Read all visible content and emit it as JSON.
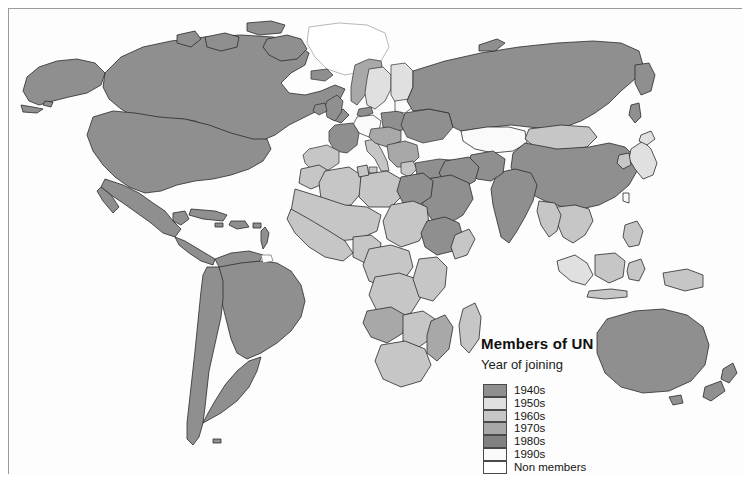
{
  "map": {
    "title": "Members of UN",
    "subtitle": "Year of joining",
    "projection": "world",
    "background_color": "#fdfdfd",
    "border_color": "#9b9b9b",
    "country_outline_color": "#2b2b2b"
  },
  "legend": {
    "title": "Members of UN",
    "subtitle": "Year of joining",
    "entries": [
      {
        "label": "1940s",
        "color": "#8f8f8f"
      },
      {
        "label": "1950s",
        "color": "#e0e0e0"
      },
      {
        "label": "1960s",
        "color": "#c6c6c6"
      },
      {
        "label": "1970s",
        "color": "#a8a8a8"
      },
      {
        "label": "1980s",
        "color": "#818181"
      },
      {
        "label": "1990s",
        "color": "#fafafa"
      },
      {
        "label": "Non members",
        "color": "#ffffff"
      }
    ]
  },
  "regions": [
    {
      "name": "Canada",
      "class": "1940s"
    },
    {
      "name": "United States",
      "class": "1940s"
    },
    {
      "name": "Greenland",
      "class": "Non members"
    },
    {
      "name": "Mexico",
      "class": "1940s"
    },
    {
      "name": "Brazil",
      "class": "1940s"
    },
    {
      "name": "Argentina",
      "class": "1940s"
    },
    {
      "name": "Russia",
      "class": "1940s"
    },
    {
      "name": "China",
      "class": "1940s"
    },
    {
      "name": "India",
      "class": "1940s"
    },
    {
      "name": "Australia",
      "class": "1940s"
    },
    {
      "name": "Egypt",
      "class": "1940s"
    },
    {
      "name": "Ethiopia",
      "class": "1940s"
    },
    {
      "name": "Japan",
      "class": "1950s"
    },
    {
      "name": "Indonesia",
      "class": "1950s"
    },
    {
      "name": "Mongolia",
      "class": "1960s"
    },
    {
      "name": "Nigeria",
      "class": "1960s"
    },
    {
      "name": "Angola",
      "class": "1970s"
    },
    {
      "name": "Mozambique",
      "class": "1970s"
    },
    {
      "name": "Switzerland",
      "class": "Non members"
    }
  ]
}
